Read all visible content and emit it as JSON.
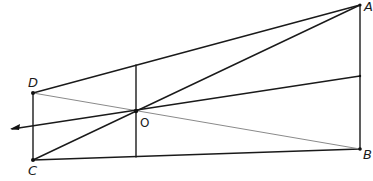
{
  "diagram": {
    "kind": "geometry-construction",
    "points": [
      {
        "name": "A",
        "label": "A",
        "x": 360,
        "y": 5
      },
      {
        "name": "B",
        "label": "B",
        "x": 360,
        "y": 149
      },
      {
        "name": "C",
        "label": "C",
        "x": 33,
        "y": 160
      },
      {
        "name": "D",
        "label": "D",
        "x": 33,
        "y": 93
      },
      {
        "name": "O",
        "label": "O",
        "x": 136,
        "y": 111
      }
    ],
    "segments": [
      {
        "from": "D",
        "to": "C",
        "style": "dark"
      },
      {
        "from": "A",
        "to": "B",
        "style": "dark"
      },
      {
        "from": "D",
        "to": "A",
        "style": "dark"
      },
      {
        "from": "C",
        "to": "B",
        "style": "dark"
      },
      {
        "from": "C",
        "to": "A",
        "style": "dark",
        "passes_through": "O"
      },
      {
        "from": "D",
        "to": "B",
        "style": "light",
        "passes_through": "O"
      },
      {
        "from": "AB-mid",
        "to": "arrow-left",
        "style": "dark",
        "passes_through": "O",
        "arrow": "left"
      },
      {
        "from": "DA-point",
        "to": "CB-point",
        "style": "dark",
        "vertical_through": "O"
      }
    ],
    "labels": {
      "A": "A",
      "B": "B",
      "C": "C",
      "D": "D",
      "O": "O"
    },
    "colors": {
      "ink": "#1a1a1a",
      "light_ink": "#8a8a8a",
      "background": "#ffffff"
    }
  }
}
